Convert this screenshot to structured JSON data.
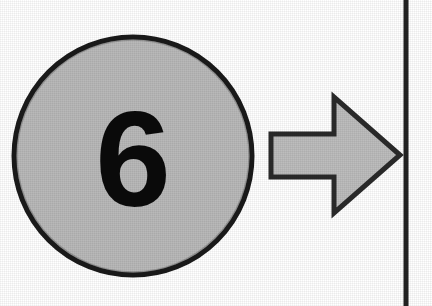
{
  "figure": {
    "background_color": "#ffffff",
    "width": 432,
    "height": 306
  },
  "disc": {
    "label": "6",
    "fill_color": "#b9b9b9",
    "stroke_color": "#1a1a1a",
    "center_x": 133,
    "center_y": 156,
    "radius": 121,
    "stroke_width": 5
  },
  "arrow": {
    "direction": "right",
    "fill_color": "#bdbdbd",
    "stroke_color": "#2a2a2a",
    "stroke_width": 5,
    "shaft_left": 271,
    "shaft_top": 134,
    "shaft_bottom": 177,
    "head_base_x": 334,
    "head_top": 97,
    "head_bottom": 213,
    "tip_x": 400,
    "tip_y": 155
  },
  "divider": {
    "orientation": "vertical",
    "color": "#232323",
    "x": 404,
    "top": 0,
    "bottom": 306,
    "width": 5
  }
}
